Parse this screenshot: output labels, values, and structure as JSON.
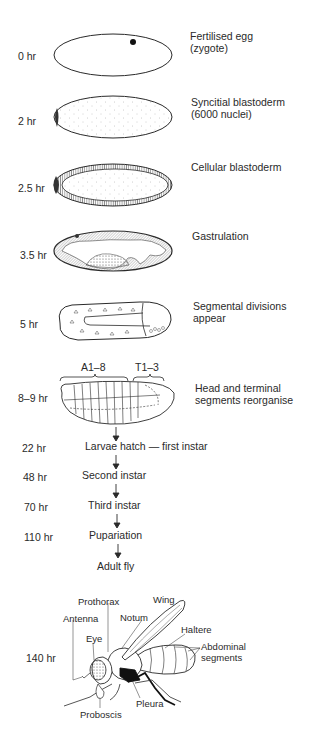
{
  "figure": {
    "stages": [
      {
        "time": "0 hr",
        "description_line1": "Fertilised egg",
        "description_line2": "(zygote)"
      },
      {
        "time": "2 hr",
        "description_line1": "Syncitial blastoderm",
        "description_line2": "(6000 nuclei)"
      },
      {
        "time": "2.5 hr",
        "description_line1": "Cellular blastoderm",
        "description_line2": ""
      },
      {
        "time": "3.5 hr",
        "description_line1": "Gastrulation",
        "description_line2": ""
      },
      {
        "time": "5 hr",
        "description_line1": "Segmental divisions",
        "description_line2": "appear"
      },
      {
        "time": "8–9 hr",
        "description_line1": "Head and terminal",
        "description_line2": "segments reorganise"
      }
    ],
    "segment_labels": {
      "abdominal": "A1–8",
      "thoracic": "T1–3"
    },
    "post_embryonic": [
      {
        "time": "22 hr",
        "label": "Larvae hatch — first instar"
      },
      {
        "time": "48 hr",
        "label": "Second instar"
      },
      {
        "time": "70 hr",
        "label": "Third instar"
      },
      {
        "time": "110 hr",
        "label": "Pupariation"
      },
      {
        "time": "",
        "label": "Adult fly"
      }
    ],
    "adult": {
      "time": "140 hr",
      "parts": {
        "prothorax": "Prothorax",
        "wing": "Wing",
        "antenna": "Antenna",
        "notum": "Notum",
        "haltere": "Haltere",
        "eye": "Eye",
        "abdominal_line1": "Abdominal",
        "abdominal_line2": "segments",
        "pleura": "Pleura",
        "proboscis": "Proboscis"
      }
    },
    "colors": {
      "ink": "#2a2a2a",
      "background": "#ffffff"
    }
  }
}
